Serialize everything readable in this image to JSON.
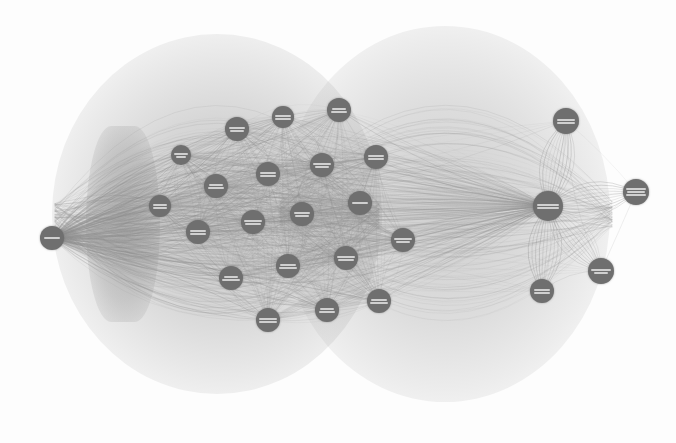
{
  "visualization": {
    "type": "force-directed network graph",
    "title_visible": false,
    "background_color": "#fdfdfd",
    "node_color": "#6f6f6f",
    "node_label_color": "#e2e2e2",
    "edge_color": "#9a9a9a",
    "labels_legible": false,
    "label_note": "Node labels are rendered at sub-pixel size and are not legible in the source image",
    "width": 676,
    "height": 443
  },
  "graph_data": {
    "type": "node-link",
    "layout": "two-hub force-directed with curved (arc) edges",
    "node_count": 26,
    "hub_count": 2,
    "nodes": [
      {
        "id": "n1",
        "cx": 52,
        "cy": 238,
        "r": 12,
        "lines": 1,
        "role": "hub-left-terminal"
      },
      {
        "id": "n2",
        "cx": 237,
        "cy": 129,
        "r": 12,
        "lines": 2,
        "role": "cluster-left"
      },
      {
        "id": "n3",
        "cx": 283,
        "cy": 117,
        "r": 11,
        "lines": 2,
        "role": "cluster-left"
      },
      {
        "id": "n4",
        "cx": 339,
        "cy": 110,
        "r": 12,
        "lines": 2,
        "role": "cluster-right"
      },
      {
        "id": "n5",
        "cx": 376,
        "cy": 157,
        "r": 12,
        "lines": 2,
        "role": "cluster-right"
      },
      {
        "id": "n6",
        "cx": 322,
        "cy": 165,
        "r": 12,
        "lines": 2,
        "role": "cluster-right"
      },
      {
        "id": "n7",
        "cx": 268,
        "cy": 174,
        "r": 12,
        "lines": 2,
        "role": "cluster-left"
      },
      {
        "id": "n8",
        "cx": 216,
        "cy": 186,
        "r": 12,
        "lines": 2,
        "role": "cluster-left"
      },
      {
        "id": "n9",
        "cx": 198,
        "cy": 232,
        "r": 12,
        "lines": 2,
        "role": "cluster-left"
      },
      {
        "id": "n10",
        "cx": 253,
        "cy": 222,
        "r": 12,
        "lines": 2,
        "role": "cluster-left"
      },
      {
        "id": "n11",
        "cx": 302,
        "cy": 214,
        "r": 12,
        "lines": 2,
        "role": "cluster-center"
      },
      {
        "id": "n12",
        "cx": 360,
        "cy": 203,
        "r": 12,
        "lines": 1,
        "role": "cluster-right"
      },
      {
        "id": "n13",
        "cx": 403,
        "cy": 240,
        "r": 12,
        "lines": 2,
        "role": "cluster-right"
      },
      {
        "id": "n14",
        "cx": 346,
        "cy": 258,
        "r": 12,
        "lines": 2,
        "role": "cluster-right"
      },
      {
        "id": "n15",
        "cx": 288,
        "cy": 266,
        "r": 12,
        "lines": 2,
        "role": "cluster-center"
      },
      {
        "id": "n16",
        "cx": 231,
        "cy": 278,
        "r": 12,
        "lines": 2,
        "role": "cluster-left"
      },
      {
        "id": "n17",
        "cx": 268,
        "cy": 320,
        "r": 12,
        "lines": 2,
        "role": "cluster-left"
      },
      {
        "id": "n18",
        "cx": 327,
        "cy": 310,
        "r": 12,
        "lines": 2,
        "role": "cluster-center"
      },
      {
        "id": "n19",
        "cx": 379,
        "cy": 301,
        "r": 12,
        "lines": 2,
        "role": "cluster-right"
      },
      {
        "id": "n20",
        "cx": 548,
        "cy": 206,
        "r": 15,
        "lines": 2,
        "role": "hub-right"
      },
      {
        "id": "n21",
        "cx": 566,
        "cy": 121,
        "r": 13,
        "lines": 2,
        "role": "peripheral-top-right"
      },
      {
        "id": "n22",
        "cx": 636,
        "cy": 192,
        "r": 13,
        "lines": 3,
        "role": "peripheral-far-right"
      },
      {
        "id": "n23",
        "cx": 601,
        "cy": 271,
        "r": 13,
        "lines": 2,
        "role": "peripheral-bottom-right"
      },
      {
        "id": "n24",
        "cx": 542,
        "cy": 291,
        "r": 12,
        "lines": 2,
        "role": "peripheral-bottom-right"
      },
      {
        "id": "n25",
        "cx": 160,
        "cy": 206,
        "r": 11,
        "lines": 2,
        "role": "cluster-left-inner"
      },
      {
        "id": "n26",
        "cx": 181,
        "cy": 155,
        "r": 10,
        "lines": 2,
        "role": "cluster-left-inner"
      }
    ],
    "edge_style": {
      "shape": "arc",
      "bundled": true,
      "density": "very high",
      "stroke_width_range": [
        0.4,
        1.2
      ],
      "opacity_range": [
        0.12,
        0.5
      ]
    },
    "structure_notes": [
      "Dense bundled arcs radiate from the left terminal node across the whole canvas",
      "Two overlapping circular lobes of long arcs form the upper and lower envelope",
      "Right hub fans out thin distinct arcs to four peripheral nodes",
      "A dark vertical band of converging bundled edges sits left of center"
    ]
  }
}
